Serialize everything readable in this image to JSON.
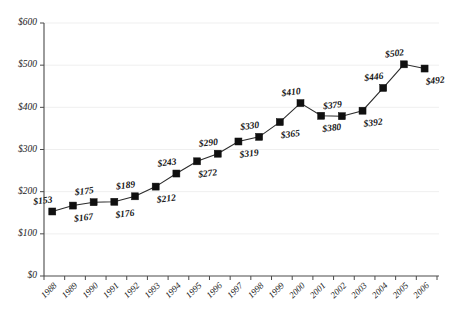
{
  "chart_data": {
    "type": "line",
    "title": "",
    "subtitle": "",
    "xlabel": "",
    "ylabel": "",
    "grid": true,
    "legend": false,
    "legend_position": "none",
    "ylim": [
      0,
      600
    ],
    "y_ticks": [
      0,
      100,
      200,
      300,
      400,
      500,
      600
    ],
    "y_tick_labels": [
      "$0",
      "$100",
      "$200",
      "$300",
      "$400",
      "$500",
      "$600"
    ],
    "categories": [
      "1988",
      "1989",
      "1990",
      "1991",
      "1992",
      "1993",
      "1994",
      "1995",
      "1996",
      "1997",
      "1998",
      "1999",
      "2000",
      "2001",
      "2002",
      "2003",
      "2004",
      "2005",
      "2006"
    ],
    "values": [
      153,
      167,
      175,
      176,
      189,
      212,
      243,
      272,
      290,
      319,
      330,
      365,
      410,
      380,
      379,
      392,
      446,
      502,
      492
    ],
    "point_labels": [
      "$153",
      "$167",
      "$175",
      "$176",
      "$189",
      "$212",
      "$243",
      "$272",
      "$290",
      "$319",
      "$330",
      "$365",
      "$410",
      "$380",
      "$379",
      "$392",
      "$446",
      "$502",
      "$492"
    ],
    "label_positions": [
      "above",
      "below",
      "above",
      "below",
      "above",
      "below",
      "above",
      "below",
      "above",
      "below",
      "above",
      "below",
      "above",
      "below",
      "above",
      "below",
      "above",
      "above",
      "below"
    ],
    "marker": "square",
    "marker_color": "#101010",
    "line_color": "#2b2b2b",
    "grid_color": "#ededed",
    "axis_color": "#4a4a4a",
    "background_color": "#ffffff",
    "x_tick_rotation": 45
  }
}
